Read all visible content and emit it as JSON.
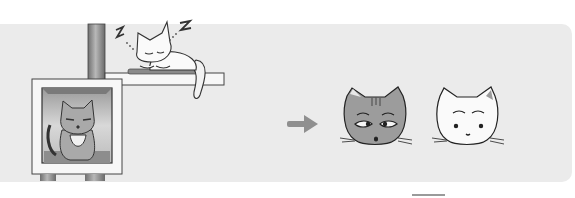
{
  "illustration": {
    "title": "Cat comparison illustration",
    "left_scene": {
      "description": "Sleeping cat on shelf above a cat in a box on a cat tree",
      "sleeping_cat": {
        "sound": "Z Z",
        "pose": "sleeping"
      },
      "box_cat": {
        "pattern": "tabby",
        "expression": "suspicious"
      }
    },
    "arrow": {
      "direction": "right",
      "icon": "arrow-right-icon"
    },
    "faces": [
      {
        "name": "tabby-cat-face",
        "pattern": "tabby",
        "expression": "sly"
      },
      {
        "name": "white-cat-face",
        "pattern": "white",
        "expression": "surprised"
      }
    ],
    "colors": {
      "background": "#ffffff",
      "panel": "#ebebeb",
      "line": "#333333",
      "pole": "#8a8a8a",
      "tabby": "#9c9c9c",
      "arrow": "#8f8f8f"
    }
  }
}
